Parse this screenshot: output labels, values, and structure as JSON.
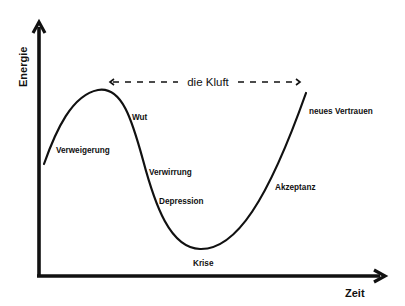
{
  "diagram": {
    "type": "change-curve",
    "title": "",
    "axes": {
      "y_label": "Energie",
      "x_label": "Zeit"
    },
    "gap": {
      "label": "die Kluft",
      "style": "dashed double-headed arrow"
    },
    "stages": [
      {
        "id": "verweigerung",
        "label": "Verweigerung"
      },
      {
        "id": "wut",
        "label": "Wut"
      },
      {
        "id": "verwirrung",
        "label": "Verwirrung"
      },
      {
        "id": "depression",
        "label": "Depression"
      },
      {
        "id": "krise",
        "label": "Krise"
      },
      {
        "id": "akzeptanz",
        "label": "Akzeptanz"
      },
      {
        "id": "neues-vertrauen",
        "label": "neues Vertrauen"
      }
    ],
    "colors": {
      "line": "#111111",
      "background": "#ffffff",
      "text": "#111111"
    }
  }
}
